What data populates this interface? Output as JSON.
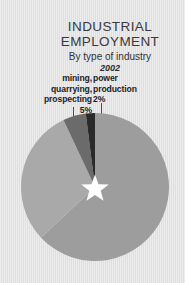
{
  "page": {
    "background_color": "#e2e3e2"
  },
  "title": {
    "line1": "INDUSTRIAL",
    "line2": "EMPLOYMENT",
    "subtitle": "By type of industry",
    "year": "2002"
  },
  "labels": {
    "mining": {
      "name": "mining,\nquarrying,\nprospecting",
      "name_line1": "mining,",
      "name_line2": "quarrying,",
      "name_line3": "prospecting",
      "pct": "5%"
    },
    "power": {
      "name_line1": "power",
      "name_line2": "production",
      "pct": "2%"
    },
    "construction": {
      "name_line1": "construction",
      "pct": "30%"
    },
    "manufacturing": {
      "name_line1": "manufacturing",
      "pct": "63%"
    }
  },
  "chart_data": {
    "type": "pie",
    "title": "INDUSTRIAL EMPLOYMENT",
    "subtitle": "By type of industry",
    "year": "2002",
    "categories": [
      "manufacturing",
      "construction",
      "mining, quarrying, prospecting",
      "power production"
    ],
    "values": [
      63,
      30,
      5,
      2
    ],
    "unit": "%",
    "colors": [
      "#9c9d9c",
      "#a8a9a8",
      "#6a6b6a",
      "#2a2a2b"
    ],
    "start_angle_deg": 0,
    "direction": "clockwise",
    "center_marker": "white-five-pointed-star",
    "center_marker_color": "#ffffff",
    "legend": "none",
    "labels_position": "callout",
    "grid": false
  }
}
